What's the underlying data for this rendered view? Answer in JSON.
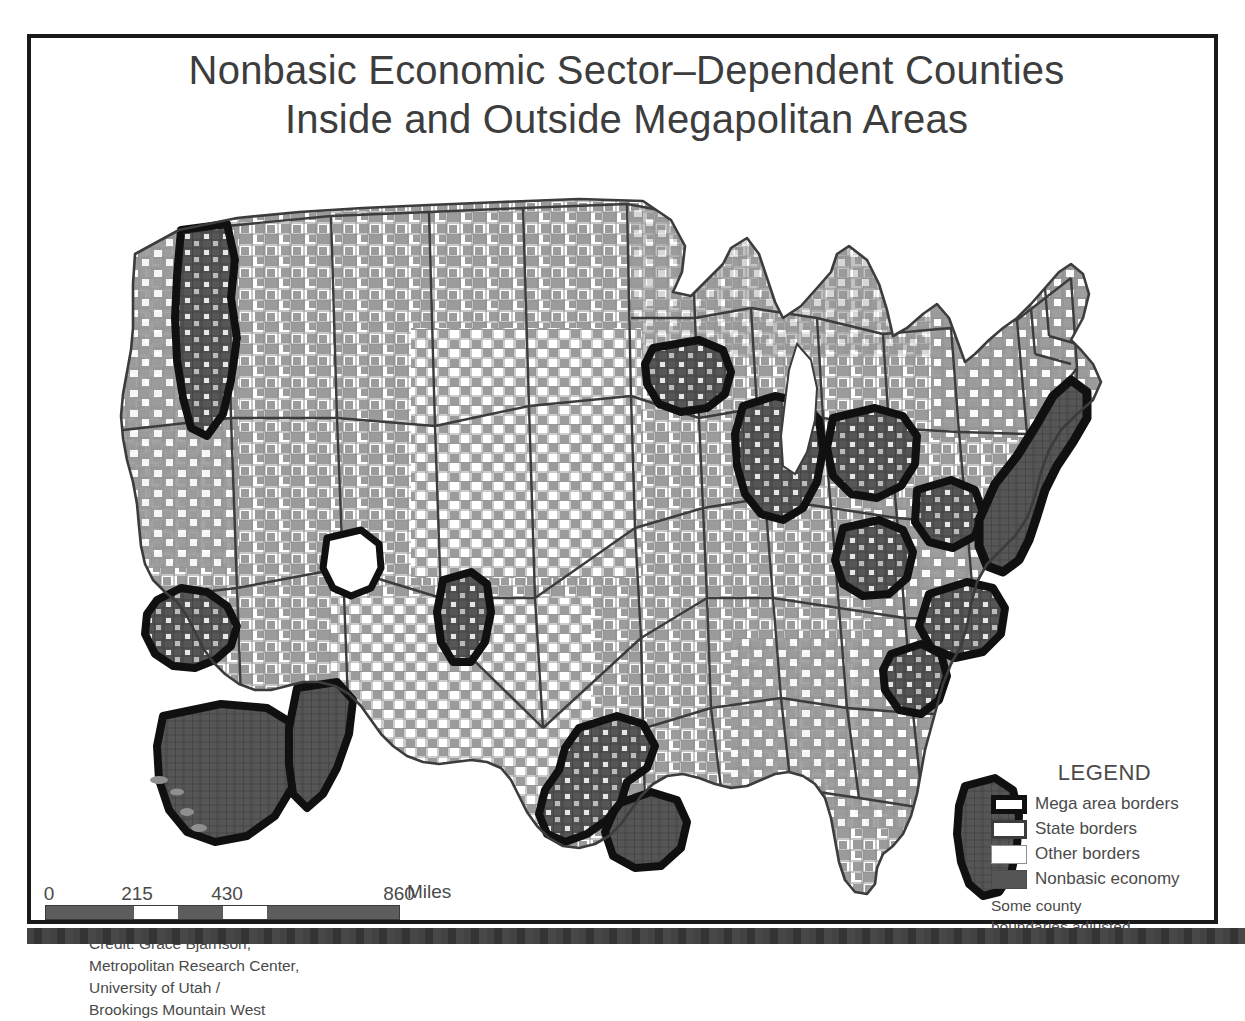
{
  "poster": {
    "title_line_1": "Nonbasic Economic Sector–Dependent Counties",
    "title_line_2": "Inside and Outside Megapolitan Areas"
  },
  "map": {
    "subject": "United States counties",
    "projection_note": "contiguous United States",
    "colors": {
      "nonbasic_outside_mega": "#9b9b9b",
      "nonbasic_inside_mega": "#565656",
      "other_counties": "#ffffff",
      "county_border": "#8f8f8f",
      "state_border": "#3c3c3c",
      "mega_border": "#101010",
      "background": "#ffffff"
    },
    "megapolitan_areas": [
      "Cascadia",
      "Northern California",
      "Southern California",
      "Valley of the Sun",
      "Wasatch Front",
      "Front Range",
      "Twin Cities",
      "Chicago / Great Lakes",
      "Michigan Corridor",
      "Ohio Valley",
      "Steel Corridor",
      "Northeast Megalopolis",
      "Piedmont",
      "Carolina Piedmont",
      "Peninsula (Florida)",
      "Gulf Coast",
      "I-35 Corridor (Texas Triangle)"
    ]
  },
  "scale_bar": {
    "ticks": [
      "0",
      "215",
      "430",
      "860"
    ],
    "units_label": "Miles",
    "max_value": 860
  },
  "credit": {
    "lines": [
      "Credit: Grace Bjarnson,",
      "Metropolitan Research Center,",
      "University of Utah /",
      "Brookings Mountain West"
    ]
  },
  "legend": {
    "heading": "LEGEND",
    "items": [
      {
        "label": "Mega area borders",
        "swatch": "mega"
      },
      {
        "label": "State borders",
        "swatch": "state"
      },
      {
        "label": "Other borders",
        "swatch": "other"
      },
      {
        "label": "Nonbasic economy",
        "swatch": "nonbasic"
      }
    ],
    "note_lines": [
      "Some county",
      "boundaries adjusted"
    ]
  }
}
